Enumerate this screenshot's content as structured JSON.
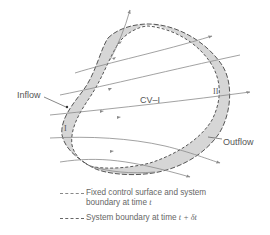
{
  "figure": {
    "labels": {
      "inflow": "Inflow",
      "outflow": "Outflow",
      "cv": "CV–I",
      "region_one": "I",
      "region_two": "II"
    },
    "legend": [
      {
        "style": "dashed-fine",
        "text_line1": "Fixed control surface and system",
        "text_line2_prefix": "boundary at time ",
        "text_line2_var": "t"
      },
      {
        "style": "dashed-coarse",
        "text_line1_prefix": "System boundary at time ",
        "text_line1_var": "t + δt"
      }
    ],
    "colors": {
      "shaded_region": "#d6d6d6",
      "boundary": "#555555",
      "streamline": "#8a8a8a",
      "text": "#555555"
    }
  }
}
